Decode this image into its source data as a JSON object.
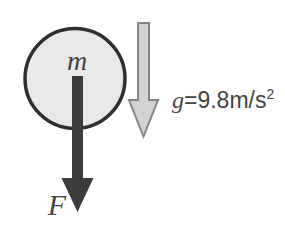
{
  "diagram": {
    "labels": {
      "mass": "m",
      "force": "F",
      "gravity_symbol": "g",
      "gravity_value": "=9.8m/s",
      "gravity_exponent": "2"
    },
    "colors": {
      "background": "#ffffff",
      "circle_fill": "#e9e9e9",
      "circle_stroke": "#2f2f2f",
      "force_arrow": "#3c3c3c",
      "gravity_arrow_fill": "#d2d2d2",
      "gravity_arrow_stroke": "#858585",
      "text": "#444444"
    }
  }
}
